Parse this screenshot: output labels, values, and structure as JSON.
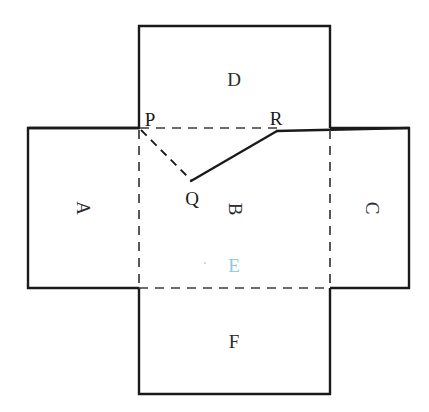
{
  "figure": {
    "name": "cube-net-diagram",
    "background_color": "#ffffff",
    "stroke_color": "#1a1a1a",
    "dashed_color": "#3a3a3a",
    "faces": [
      {
        "id": "A",
        "label": "A",
        "orientation": "rotated-90",
        "cx": 83,
        "cy": 208
      },
      {
        "id": "B",
        "label": "B",
        "orientation": "rotated-90",
        "cx": 235,
        "cy": 209
      },
      {
        "id": "C",
        "label": "C",
        "orientation": "rotated-90",
        "cx": 372,
        "cy": 208
      },
      {
        "id": "D",
        "label": "D",
        "orientation": "upright",
        "cx": 234,
        "cy": 79
      },
      {
        "id": "E",
        "label": "E",
        "orientation": "upright",
        "cx": 234,
        "cy": 265,
        "color": "#8ec8e8"
      },
      {
        "id": "F",
        "label": "F",
        "orientation": "upright",
        "cx": 234,
        "cy": 341
      }
    ],
    "vertices": [
      {
        "id": "P",
        "label": "P",
        "x": 140,
        "y": 128,
        "label_x": 150,
        "label_y": 119
      },
      {
        "id": "Q",
        "label": "Q",
        "x": 192,
        "y": 181,
        "label_x": 192,
        "label_y": 198
      },
      {
        "id": "R",
        "label": "R",
        "x": 276,
        "y": 131,
        "label_x": 276,
        "label_y": 118
      }
    ],
    "rectangles": {
      "center_left": 139,
      "center_right": 330,
      "center_top": 128,
      "center_bottom": 288,
      "outer_left": 28,
      "outer_right": 409,
      "outer_top": 26,
      "outer_bottom": 394
    },
    "segments": {
      "solid_path": "Q-R",
      "dashed_path": "P-Q",
      "dashed_top": "P-R",
      "dashed_vertical_left": true,
      "dashed_vertical_right": true,
      "dashed_bottom": true
    }
  }
}
